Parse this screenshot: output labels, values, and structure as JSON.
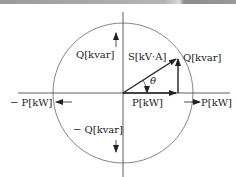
{
  "diagram": {
    "labels": {
      "q_positive_left": "Q[kvar]",
      "s_vector": "S[kV·A]",
      "q_vector": "Q[kvar]",
      "theta": "θ",
      "neg_p": "− P[kW]",
      "p_origin": "P[kW]",
      "p_positive": "P[kW]",
      "neg_q": "− Q[kvar]"
    },
    "colors": {
      "line": "#222222",
      "circle": "#555555",
      "topbar": "#9a9a9a"
    }
  }
}
